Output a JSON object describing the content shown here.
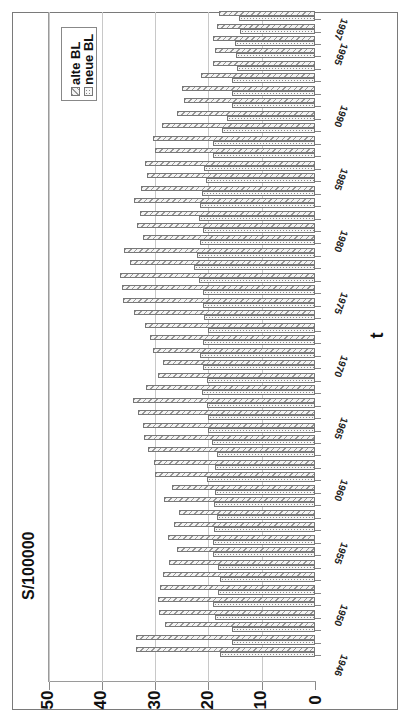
{
  "chart_data": {
    "type": "bar",
    "orientation": "rotated 90° (chart printed sideways; value axis horizontal, time axis vertical, 1946 at bottom)",
    "title": "",
    "ylabel": "S/100000",
    "xlabel": "t",
    "ylim": [
      0,
      50
    ],
    "y_ticks": [
      "0",
      "10",
      "20",
      "30",
      "40",
      "50"
    ],
    "x_tick_labels": [
      "1946",
      "1950",
      "1955",
      "1960",
      "1965",
      "1970",
      "1975",
      "1980",
      "1985",
      "1990",
      "1995",
      "1997"
    ],
    "grid": "major gridlines at 10-unit intervals",
    "legend": {
      "position": "upper-left (rotated view)",
      "entries": [
        "alte BL",
        "neue BL"
      ]
    },
    "categories": [
      1946,
      1947,
      1948,
      1949,
      1950,
      1951,
      1952,
      1953,
      1954,
      1955,
      1956,
      1957,
      1958,
      1959,
      1960,
      1961,
      1962,
      1963,
      1964,
      1965,
      1966,
      1967,
      1968,
      1969,
      1970,
      1971,
      1972,
      1973,
      1974,
      1975,
      1976,
      1977,
      1978,
      1979,
      1980,
      1981,
      1982,
      1983,
      1984,
      1985,
      1986,
      1987,
      1988,
      1989,
      1990,
      1991,
      1992,
      1993,
      1994,
      1995,
      1996,
      1997
    ],
    "series": [
      {
        "name": "alte BL",
        "pattern": "diagonal-hatch",
        "values": [
          33.6,
          33.6,
          28.1,
          29.3,
          29.4,
          29.1,
          28.5,
          27.4,
          25.9,
          27.6,
          26.4,
          25.5,
          28.3,
          26.8,
          30.0,
          30.2,
          31.3,
          32.0,
          32.2,
          33.3,
          34.1,
          31.7,
          29.4,
          28.5,
          30.4,
          31.0,
          31.9,
          34.0,
          36.0,
          36.2,
          36.6,
          34.7,
          35.8,
          32.2,
          33.4,
          32.8,
          34.0,
          32.6,
          31.5,
          31.9,
          30.0,
          30.4,
          28.7,
          25.9,
          24.6,
          25.0,
          21.4,
          19.1,
          18.8,
          19.1,
          18.3,
          18.0
        ]
      },
      {
        "name": "neue BL",
        "pattern": "dotted",
        "values": [
          17.8,
          15.6,
          15.6,
          18.8,
          19.1,
          18.2,
          17.8,
          18.2,
          19.1,
          19.1,
          18.9,
          18.4,
          18.9,
          18.8,
          20.3,
          18.8,
          18.4,
          19.3,
          20.0,
          20.0,
          20.3,
          21.2,
          20.3,
          21.0,
          21.6,
          21.0,
          20.0,
          20.8,
          21.0,
          21.0,
          21.8,
          22.7,
          22.1,
          21.6,
          21.0,
          21.8,
          21.6,
          21.2,
          20.5,
          20.8,
          19.1,
          19.1,
          17.5,
          16.5,
          15.6,
          15.6,
          15.6,
          14.7,
          14.8,
          15.0,
          14.1,
          14.2
        ]
      }
    ]
  },
  "labels": {
    "ylabel": "S/100000",
    "xlabel": "t",
    "legend_alte": "alte BL",
    "legend_neue": "neue BL"
  }
}
